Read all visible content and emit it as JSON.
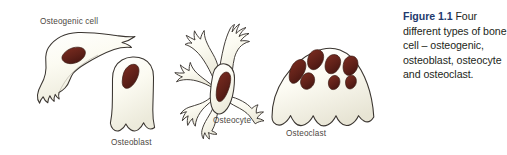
{
  "figure": {
    "background_color": "#ffffff",
    "cell_fill_color": "#fbfaf0",
    "cell_outline_color": "#3a3530",
    "nucleus_color": "#5e2018",
    "nucleus_outline_color": "#3a1a12",
    "label_color": "#4c4742"
  },
  "cells": [
    {
      "id": "osteogenic",
      "label": "Osteogenic cell",
      "shape": "elongated spindle-shaped cell with pointed tail and ruffled lower edge",
      "nuclei_count": 1
    },
    {
      "id": "osteoblast",
      "label": "Osteoblast",
      "shape": "cuboidal / columnar cell with rounded top and wavy base",
      "nuclei_count": 1
    },
    {
      "id": "osteocyte",
      "label": "Osteocyte",
      "shape": "stellate cell with long branching dendritic processes",
      "nuclei_count": 1
    },
    {
      "id": "osteoclast",
      "label": "Osteoclast",
      "shape": "large dome-shaped multinucleate cell with ruffled border",
      "nuclei_count": 7
    }
  ],
  "caption": {
    "number": "Figure 1.1",
    "number_color": "#1f3a6e",
    "text": " Four different types of bone cell – osteogenic, osteoblast, osteocyte and osteoclast.",
    "full_text": "Figure 1.1 Four different types of bone cell – osteogenic, osteoblast, osteocyte and osteoclast."
  }
}
